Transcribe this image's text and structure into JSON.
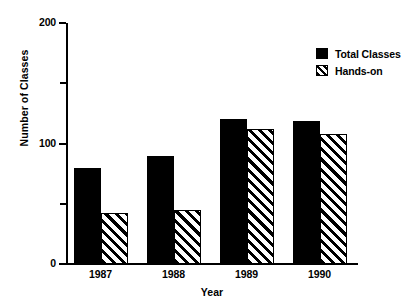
{
  "chart_data": {
    "type": "bar",
    "title": "",
    "xlabel": "Year",
    "ylabel": "Number of Classes",
    "categories": [
      "1987",
      "1988",
      "1989",
      "1990"
    ],
    "series": [
      {
        "name": "Total Classes",
        "values": [
          80,
          90,
          120,
          119
        ],
        "fill": "solid",
        "color": "#000000"
      },
      {
        "name": "Hands-on",
        "values": [
          42,
          45,
          112,
          108
        ],
        "fill": "hatch",
        "color": "#000000"
      }
    ],
    "ylim": [
      0,
      200
    ],
    "y_major_ticks": [
      0,
      100,
      200
    ],
    "y_major_tick_labels": [
      "0",
      "100",
      "200"
    ],
    "y_minor_ticks": [
      50,
      150
    ],
    "grid": false,
    "legend_position": "top-right",
    "legend_entries": [
      "Total Classes",
      "Hands-on"
    ],
    "background_color": "#ffffff",
    "axis_color": "#000000"
  },
  "axes": {
    "y_title": "Number of Classes",
    "x_title": "Year",
    "y_tick_0": "0",
    "y_tick_100": "100",
    "y_tick_200": "200",
    "x_tick_0": "1987",
    "x_tick_1": "1988",
    "x_tick_2": "1989",
    "x_tick_3": "1990"
  },
  "legend": {
    "entry_0_label": "Total Classes",
    "entry_1_label": "Hands-on"
  }
}
